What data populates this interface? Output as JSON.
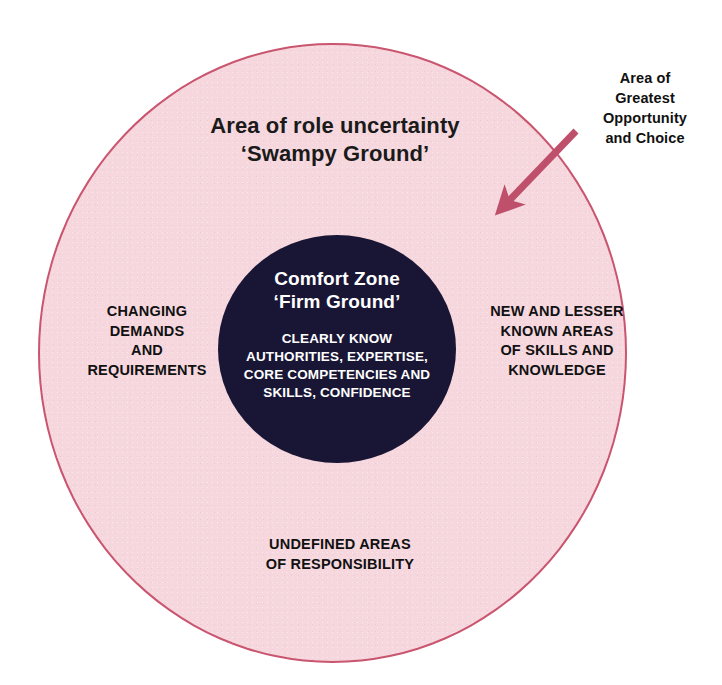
{
  "diagram": {
    "title_lines": [
      "Area of role uncertainty",
      "‘Swampy Ground’"
    ],
    "outer_zone": {
      "name": "Area of role uncertainty",
      "alias": "‘Swampy Ground’",
      "fill_color": "#f6d7de",
      "stroke_color": "#c9556f"
    },
    "inner_zone": {
      "title_lines": [
        "Comfort Zone",
        "‘Firm Ground’"
      ],
      "body_lines": [
        "CLEARLY KNOW",
        "AUTHORITIES, EXPERTISE,",
        "CORE COMPETENCIES AND",
        "SKILLS, CONFIDENCE"
      ],
      "fill_color": "#191635",
      "text_color": "#ffffff"
    },
    "labels": {
      "left": [
        "CHANGING",
        "DEMANDS",
        "AND",
        "REQUIREMENTS"
      ],
      "right": [
        "NEW AND LESSER",
        "KNOWN AREAS",
        "OF SKILLS AND",
        "KNOWLEDGE"
      ],
      "bottom": [
        "UNDEFINED AREAS",
        "OF RESPONSIBILITY"
      ]
    },
    "annotation": {
      "lines": [
        "Area of",
        "Greatest",
        "Opportunity",
        "and Choice"
      ],
      "arrow_color": "#bf506b",
      "arrow_direction": "down-left"
    },
    "text": {
      "ring_title": "Area of role uncertainty\n‘Swampy Ground’",
      "inner_title": "Comfort Zone\n‘Firm Ground’",
      "inner_body": "CLEARLY KNOW\nAUTHORITIES, EXPERTISE,\nCORE COMPETENCIES AND\nSKILLS, CONFIDENCE",
      "label_left": "CHANGING\nDEMANDS\nAND\nREQUIREMENTS",
      "label_right": "NEW AND LESSER\nKNOWN AREAS\nOF SKILLS AND\nKNOWLEDGE",
      "label_bottom": "UNDEFINED AREAS\nOF RESPONSIBILITY",
      "annotation": "Area of\nGreatest\nOpportunity\nand Choice"
    }
  }
}
